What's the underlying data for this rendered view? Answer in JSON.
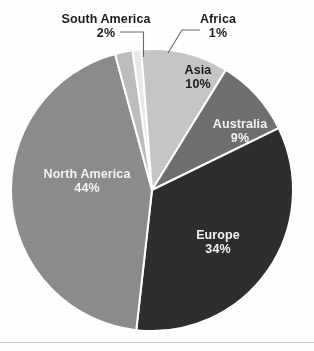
{
  "chart_data": {
    "type": "pie",
    "title": "",
    "subtitle": "",
    "xlabel": "",
    "ylabel": "",
    "legend_position": "none",
    "grid": false,
    "units": "%",
    "start_angle_deg": -8,
    "direction": "clockwise",
    "categories": [
      "Africa",
      "Asia",
      "Australia",
      "Europe",
      "North America",
      "South America"
    ],
    "values": [
      1,
      10,
      9,
      34,
      44,
      2
    ],
    "slices": [
      {
        "name": "Africa",
        "value": 1,
        "label": "Africa",
        "percent_label": "1%",
        "color": "#e9e9e9",
        "label_placement": "outside",
        "label_text_color": "#1b1b1b",
        "leader_line": true
      },
      {
        "name": "Asia",
        "value": 10,
        "label": "Asia",
        "percent_label": "10%",
        "color": "#c6c6c6",
        "label_placement": "inside",
        "label_text_color": "#1b1b1b",
        "leader_line": false
      },
      {
        "name": "Australia",
        "value": 9,
        "label": "Australia",
        "percent_label": "9%",
        "color": "#6f6f6f",
        "label_placement": "inside",
        "label_text_color": "#f4f4f4",
        "leader_line": false
      },
      {
        "name": "Europe",
        "value": 34,
        "label": "Europe",
        "percent_label": "34%",
        "color": "#2e2e2e",
        "label_placement": "inside",
        "label_text_color": "#f4f4f4",
        "leader_line": false
      },
      {
        "name": "North America",
        "value": 44,
        "label": "North America",
        "percent_label": "44%",
        "color": "#8c8c8c",
        "label_placement": "inside",
        "label_text_color": "#f4f4f4",
        "leader_line": false
      },
      {
        "name": "South America",
        "value": 2,
        "label": "South America",
        "percent_label": "2%",
        "color": "#bdbdbd",
        "label_placement": "outside",
        "label_text_color": "#1b1b1b",
        "leader_line": true
      }
    ],
    "colors": {
      "background": "#ffffff",
      "slice_separator": "#ffffff",
      "outside_label_text": "#1b1b1b",
      "inside_label_light_text": "#f4f4f4",
      "bottom_rule": "#c9c9c9"
    },
    "geometry": {
      "center_x": 152,
      "center_y": 190,
      "radius": 141
    }
  }
}
